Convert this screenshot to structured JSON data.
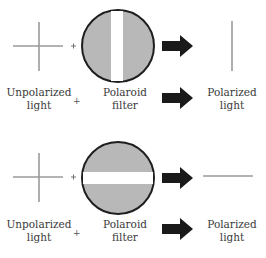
{
  "diagram": {
    "colors": {
      "ray": "#9a9a9a",
      "filter_fill": "#b8b8b8",
      "filter_border": "#1e1e1e",
      "slit": "#ffffff",
      "arrow": "#1a1a1a"
    },
    "panels": [
      {
        "orientation": "vertical",
        "input_label_line1": "Unpolarized",
        "input_label_line2": "light",
        "operator": "+",
        "filter_label_line1": "Polaroid",
        "filter_label_line2": "filter",
        "output_label_line1": "Polarized",
        "output_label_line2": "light"
      },
      {
        "orientation": "horizontal",
        "input_label_line1": "Unpolarized",
        "input_label_line2": "light",
        "operator": "+",
        "filter_label_line1": "Polaroid",
        "filter_label_line2": "filter",
        "output_label_line1": "Polarized",
        "output_label_line2": "light"
      }
    ]
  }
}
